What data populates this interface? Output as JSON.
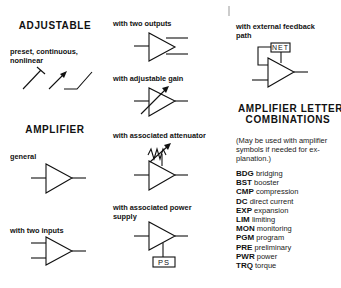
{
  "left_column": {
    "adjustable": {
      "heading": "ADJUSTABLE",
      "caption_line1": "preset, continuous,",
      "caption_line2": "nonlinear",
      "symbols": [
        "preset-icon",
        "continuous-icon",
        "nonlinear-icon"
      ]
    },
    "amplifier": {
      "heading": "AMPLIFIER",
      "general_label": "general",
      "two_inputs_label": "with two inputs"
    }
  },
  "middle_column": {
    "two_outputs_label": "with two outputs",
    "adjustable_gain_label": "with adjustable gain",
    "attenuator_label": "with associated attenuator",
    "power_supply_label_line1": "with associated power",
    "power_supply_label_line2": "supply",
    "power_supply_box": "PS"
  },
  "right_column": {
    "feedback_label_line1": "with external feedback",
    "feedback_label_line2": "path",
    "feedback_box": "NET",
    "combinations": {
      "heading_line1": "AMPLIFIER LETTER",
      "heading_line2": "COMBINATIONS",
      "note_line1": "(May be used with amplifier",
      "note_line2": "symbols if needed for ex-",
      "note_line3": "planation.)",
      "items": [
        {
          "code": "BDG",
          "meaning": "bridging"
        },
        {
          "code": "BST",
          "meaning": "booster"
        },
        {
          "code": "CMP",
          "meaning": "compression"
        },
        {
          "code": "DC",
          "meaning": "direct current"
        },
        {
          "code": "EXP",
          "meaning": "expansion"
        },
        {
          "code": "LIM",
          "meaning": "limiting"
        },
        {
          "code": "MON",
          "meaning": "monitoring"
        },
        {
          "code": "PGM",
          "meaning": "program"
        },
        {
          "code": "PRE",
          "meaning": "preliminary"
        },
        {
          "code": "PWR",
          "meaning": "power"
        },
        {
          "code": "TRQ",
          "meaning": "torque"
        }
      ]
    }
  }
}
